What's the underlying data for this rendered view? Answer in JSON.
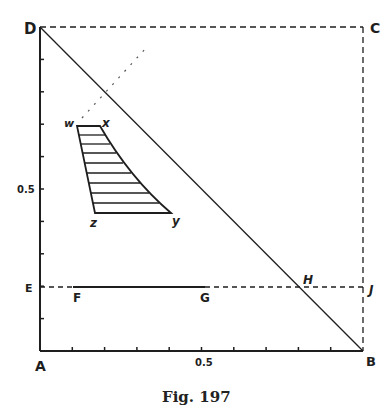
{
  "caption": "Fig. 197",
  "colors": {
    "ink": "#1e1e1e",
    "background": "#ffffff"
  },
  "points": {
    "A": "A",
    "B": "B",
    "C": "C",
    "D": "D",
    "E": "E",
    "F": "F",
    "G": "G",
    "H": "H",
    "J": "J",
    "w": "w",
    "x": "x",
    "y": "y",
    "z": "z"
  },
  "axes": {
    "x_tick_label": "0.5",
    "y_tick_label": "0.5",
    "x_ticks": 10,
    "y_ticks": 10
  },
  "hatched_region": {
    "vertices": [
      "w",
      "x",
      "y",
      "z"
    ],
    "hatch_lines": 8
  }
}
